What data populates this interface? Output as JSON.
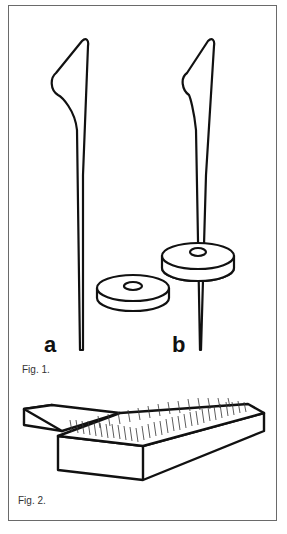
{
  "figure1": {
    "caption": "Fig. 1.",
    "labels": {
      "a": "a",
      "b": "b"
    },
    "items": [
      {
        "id": "a",
        "description": "drop spindle shaft with hook"
      },
      {
        "id": "b",
        "description": "drop spindle shaft with whorl mounted"
      },
      {
        "id": "whorl",
        "description": "loose disc whorl"
      }
    ]
  },
  "figure2": {
    "caption": "Fig. 2.",
    "description": "hand carder with wire teeth"
  },
  "colors": {
    "line": "#111111",
    "border": "#6a6a6a",
    "background": "#ffffff"
  }
}
